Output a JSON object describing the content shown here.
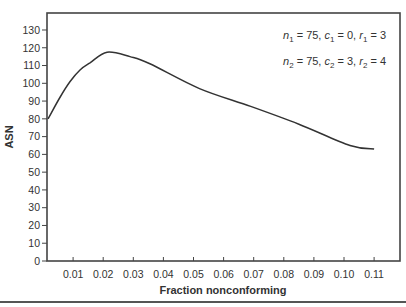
{
  "chart_data": {
    "type": "line",
    "title": "",
    "xlabel": "Fraction nonconforming",
    "ylabel": "ASN",
    "xlim": [
      0.0013,
      0.1183
    ],
    "ylim": [
      0,
      130
    ],
    "grid": false,
    "x_ticks": [
      "0.01",
      "0.02",
      "0.03",
      "0.04",
      "0.05",
      "0.06",
      "0.07",
      "0.08",
      "0.09",
      "0.10",
      "0.11"
    ],
    "y_ticks": [
      "0",
      "10",
      "20",
      "30",
      "40",
      "50",
      "60",
      "70",
      "80",
      "90",
      "100",
      "110",
      "120",
      "130"
    ],
    "series": [
      {
        "name": "ASN curve",
        "x": [
          0.0017,
          0.0056,
          0.009,
          0.0123,
          0.0156,
          0.0213,
          0.0289,
          0.0355,
          0.052,
          0.069,
          0.085,
          0.102,
          0.11
        ],
        "y": [
          80,
          92,
          101,
          107.5,
          111.5,
          117.5,
          115,
          111,
          97,
          87,
          77,
          65,
          63
        ]
      }
    ],
    "annotations": [
      {
        "parts": [
          [
            "n",
            "it"
          ],
          [
            "1",
            "sub"
          ],
          [
            " = 75, ",
            ""
          ],
          [
            "c",
            "it"
          ],
          [
            "1",
            "sub"
          ],
          [
            " = 0, ",
            ""
          ],
          [
            "r",
            "it"
          ],
          [
            "1",
            "sub"
          ],
          [
            " = 3",
            ""
          ]
        ],
        "text": "n1 = 75, c1 = 0, r1 = 3"
      },
      {
        "parts": [
          [
            "n",
            "it"
          ],
          [
            "2",
            "sub"
          ],
          [
            " = 75, ",
            ""
          ],
          [
            "c",
            "it"
          ],
          [
            "2",
            "sub"
          ],
          [
            " = 3, ",
            ""
          ],
          [
            "r",
            "it"
          ],
          [
            "2",
            "sub"
          ],
          [
            " = 4",
            ""
          ]
        ],
        "text": "n2 = 75, c2 = 3, r2 = 4"
      }
    ],
    "legend": null
  },
  "colors": {
    "line": "#333333",
    "axis": "#444444"
  }
}
